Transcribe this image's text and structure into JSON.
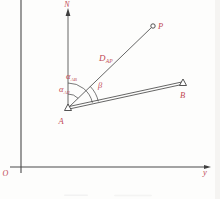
{
  "diagram": {
    "labels": {
      "north": "N",
      "point_p": "P",
      "point_a": "A",
      "point_b": "B",
      "origin": "O",
      "axis_y": "y",
      "beta": "β",
      "distance_ap": {
        "base": "D",
        "sub": "AP"
      },
      "alpha_ab": {
        "base": "α",
        "sub": "AB"
      },
      "alpha_ap": {
        "base": "α",
        "sub": "AP"
      }
    },
    "colors": {
      "label": "#c14954",
      "line": "#3f3f3f",
      "axis": "#4a4a4a"
    }
  }
}
